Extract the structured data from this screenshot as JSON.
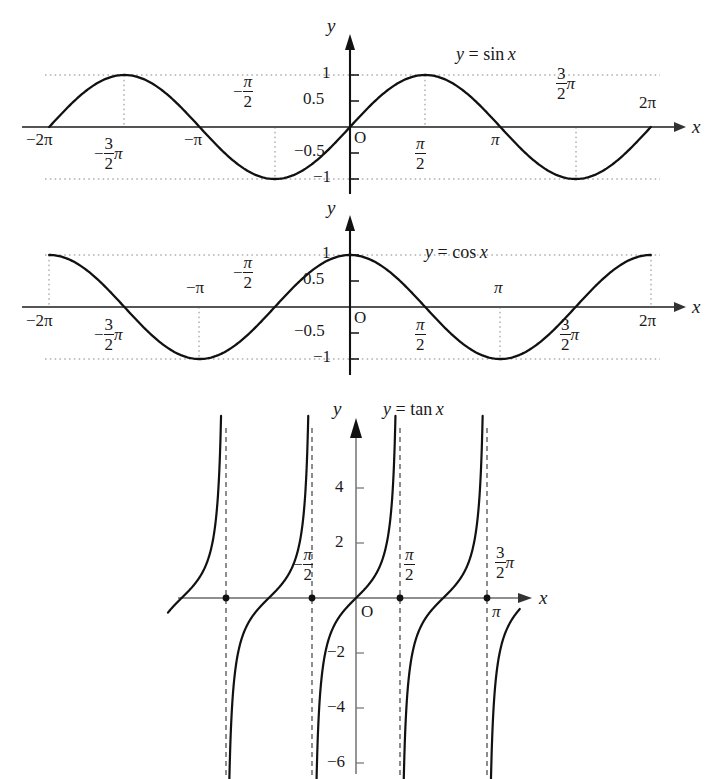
{
  "page": {
    "background": "#ffffff",
    "ink": "#1a1a1a",
    "axis_color": "#555555",
    "grid_color": "#9a9a9a"
  },
  "chart_data": [
    {
      "type": "line",
      "id": "sine",
      "title": "y = sin x",
      "xlabel": "x",
      "ylabel": "y",
      "origin_label": "O",
      "xlim": [
        -6.5973,
        6.8068
      ],
      "ylim": [
        -1.35,
        1.45
      ],
      "grid": false,
      "guide_lines": "dotted guides at y=1, y=-1 and vertical dotted drops at x=-3pi/2, -pi/2, pi/2, 3pi/2",
      "x_ticks": [
        {
          "value": -6.2832,
          "label": "−2π",
          "pos": "below-axis"
        },
        {
          "value": -4.7124,
          "label": "−(3/2)π",
          "pos": "below-axis"
        },
        {
          "value": -3.1416,
          "label": "−π",
          "pos": "below-axis"
        },
        {
          "value": -1.5708,
          "label": "−π/2",
          "pos": "above-axis"
        },
        {
          "value": 1.5708,
          "label": "π/2",
          "pos": "below-axis"
        },
        {
          "value": 3.1416,
          "label": "π",
          "pos": "below-axis"
        },
        {
          "value": 4.7124,
          "label": "(3/2)π",
          "pos": "above-axis"
        },
        {
          "value": 6.2832,
          "label": "2π",
          "pos": "above-axis"
        }
      ],
      "y_ticks": [
        {
          "value": 1,
          "label": "1"
        },
        {
          "value": 0.5,
          "label": "0.5"
        },
        {
          "value": -0.5,
          "label": "−0.5"
        },
        {
          "value": -1,
          "label": "−1"
        }
      ],
      "key_points": [
        {
          "x": -6.2832,
          "y": 0
        },
        {
          "x": -4.7124,
          "y": 1
        },
        {
          "x": -3.1416,
          "y": 0
        },
        {
          "x": -1.5708,
          "y": -1
        },
        {
          "x": 0,
          "y": 0
        },
        {
          "x": 1.5708,
          "y": 1
        },
        {
          "x": 3.1416,
          "y": 0
        },
        {
          "x": 4.7124,
          "y": -1
        },
        {
          "x": 6.2832,
          "y": 0
        }
      ]
    },
    {
      "type": "line",
      "id": "cosine",
      "title": "y = cos x",
      "xlabel": "x",
      "ylabel": "y",
      "origin_label": "O",
      "xlim": [
        -6.5973,
        6.8068
      ],
      "ylim": [
        -1.35,
        1.45
      ],
      "grid": false,
      "guide_lines": "dotted guides at y=1, y=-1 and vertical dotted drops at x=-2pi, -pi, pi, 2pi",
      "x_ticks": [
        {
          "value": -6.2832,
          "label": "−2π",
          "pos": "below-axis"
        },
        {
          "value": -4.7124,
          "label": "−(3/2)π",
          "pos": "below-axis"
        },
        {
          "value": -3.1416,
          "label": "−π",
          "pos": "above-axis"
        },
        {
          "value": -1.5708,
          "label": "−π/2",
          "pos": "above-axis"
        },
        {
          "value": 1.5708,
          "label": "π/2",
          "pos": "below-axis"
        },
        {
          "value": 3.1416,
          "label": "π",
          "pos": "above-axis"
        },
        {
          "value": 4.7124,
          "label": "(3/2)π",
          "pos": "below-axis"
        },
        {
          "value": 6.2832,
          "label": "2π",
          "pos": "below-axis"
        }
      ],
      "y_ticks": [
        {
          "value": 1,
          "label": "1"
        },
        {
          "value": 0.5,
          "label": "0.5"
        },
        {
          "value": -0.5,
          "label": "−0.5"
        },
        {
          "value": -1,
          "label": "−1"
        }
      ],
      "key_points": [
        {
          "x": -6.2832,
          "y": 1
        },
        {
          "x": -4.7124,
          "y": 0
        },
        {
          "x": -3.1416,
          "y": -1
        },
        {
          "x": -1.5708,
          "y": 0
        },
        {
          "x": 0,
          "y": 1
        },
        {
          "x": 1.5708,
          "y": 0
        },
        {
          "x": 3.1416,
          "y": -1
        },
        {
          "x": 4.7124,
          "y": 0
        },
        {
          "x": 6.2832,
          "y": 1
        }
      ]
    },
    {
      "type": "line",
      "id": "tangent",
      "title": "y = tan x",
      "xlabel": "x",
      "ylabel": "y",
      "origin_label": "O",
      "xlim": [
        -6.45,
        4.7
      ],
      "ylim": [
        -6.4,
        6.2
      ],
      "grid": false,
      "asymptotes": [
        -4.7124,
        -1.5708,
        1.5708,
        4.7124
      ],
      "asymptote_style": "dashed",
      "x_ticks": [
        {
          "value": -4.7124,
          "label": "",
          "pos": "dot"
        },
        {
          "value": -1.5708,
          "label": "−π/2",
          "pos": "above-axis"
        },
        {
          "value": 1.5708,
          "label": "π/2",
          "pos": "above-axis"
        },
        {
          "value": 3.1416,
          "label": "π",
          "pos": "below-axis"
        },
        {
          "value": 4.7124,
          "label": "(3/2)π",
          "pos": "above-axis"
        }
      ],
      "y_ticks": [
        {
          "value": 4,
          "label": "4"
        },
        {
          "value": 2,
          "label": "2"
        },
        {
          "value": -2,
          "label": "−2"
        },
        {
          "value": -4,
          "label": "−4"
        },
        {
          "value": -6,
          "label": "−6"
        }
      ],
      "zero_dots": [
        -6.2832,
        -3.1416,
        0,
        3.1416
      ],
      "zero_dots_drawn": [
        -4.7124,
        -1.5708,
        1.5708,
        4.7124
      ],
      "branches": "five branches between consecutive asymptotes; each rises from -inf to +inf"
    }
  ],
  "labels": {
    "axis_x": "x",
    "axis_y": "y",
    "origin": "O",
    "sin_equation": {
      "lhs": "y",
      "eq": "=",
      "rhs": "sin",
      "arg": "x"
    },
    "cos_equation": {
      "lhs": "y",
      "eq": "=",
      "rhs": "cos",
      "arg": "x"
    },
    "tan_equation": {
      "lhs": "y",
      "eq": "=",
      "rhs": "tan",
      "arg": "x"
    },
    "pi": "π",
    "minus": "−",
    "two_pi": "2π",
    "minus_two_pi": "−2π",
    "minus_pi": "−π",
    "three": "3",
    "two": "2",
    "one": "1",
    "half": "0.5",
    "minus_half": "−0.5",
    "minus_one": "−1",
    "t4": "4",
    "t2": "2",
    "tm2": "−2",
    "tm4": "−4",
    "tm6": "−6"
  }
}
